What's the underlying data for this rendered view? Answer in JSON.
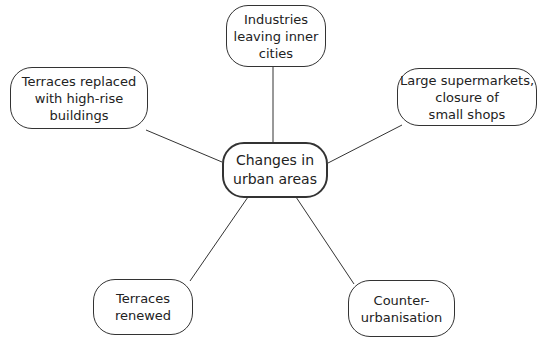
{
  "center": {
    "label": "Changes in\nurban areas"
  },
  "nodes": [
    {
      "id": "industries",
      "label": "Industries\nleaving inner\ncities"
    },
    {
      "id": "terraces-replaced",
      "label": "Terraces replaced\nwith high-rise\nbuildings"
    },
    {
      "id": "supermarkets",
      "label": "Large supermarkets,\nclosure of\nsmall shops"
    },
    {
      "id": "terraces-renewed",
      "label": "Terraces\nrenewed"
    },
    {
      "id": "counter-urbanisation",
      "label": "Counter-\nurbanisation"
    }
  ],
  "colors": {
    "stroke": "#333333",
    "background": "#ffffff"
  }
}
